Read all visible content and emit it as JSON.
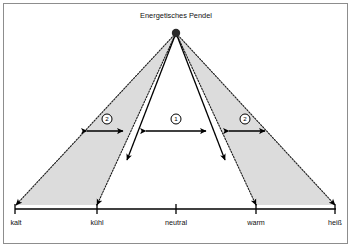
{
  "figure": {
    "title": "Energetisches Pendel",
    "frame": {
      "border_color": "#8d8d8d",
      "background": "#ffffff"
    },
    "wedge_fill": "#dcdcdc",
    "pivot": {
      "x": 176,
      "y": 33,
      "radius": 4.2
    }
  },
  "axis": {
    "y": 209,
    "x_start": 15,
    "x_end": 336,
    "ticks": [
      {
        "label": "kalt",
        "x": 15
      },
      {
        "label": "kühl",
        "x": 97
      },
      {
        "label": "neutral",
        "x": 176
      },
      {
        "label": "warm",
        "x": 256
      },
      {
        "label": "heiß",
        "x": 335
      }
    ]
  },
  "rays": {
    "inner_left": {
      "x1": 176,
      "y1": 33,
      "x2": 127,
      "y2": 160,
      "style": "solid",
      "arrow": true
    },
    "inner_right": {
      "x1": 176,
      "y1": 33,
      "x2": 225,
      "y2": 160,
      "style": "solid",
      "arrow": true
    },
    "outer_left": {
      "x1": 176,
      "y1": 33,
      "x2": 97,
      "y2": 205,
      "style": "dotted",
      "arrow": true
    },
    "outer_right": {
      "x1": 176,
      "y1": 33,
      "x2": 256,
      "y2": 205,
      "style": "dotted",
      "arrow": true
    },
    "far_left": {
      "x1": 176,
      "y1": 33,
      "x2": 16,
      "y2": 205,
      "style": "dotted",
      "arrow": true
    },
    "far_right": {
      "x1": 176,
      "y1": 33,
      "x2": 335,
      "y2": 205,
      "style": "dotted",
      "arrow": true
    }
  },
  "measures": [
    {
      "id": "left",
      "badge": "②",
      "badge_x": 107,
      "badge_y": 119,
      "x1": 81,
      "x2": 129,
      "y": 131
    },
    {
      "id": "center",
      "badge": "①",
      "badge_x": 176,
      "badge_y": 119,
      "x1": 140,
      "x2": 212,
      "y": 131
    },
    {
      "id": "right",
      "badge": "②",
      "badge_x": 245,
      "badge_y": 119,
      "x1": 223,
      "x2": 271,
      "y": 131
    }
  ]
}
